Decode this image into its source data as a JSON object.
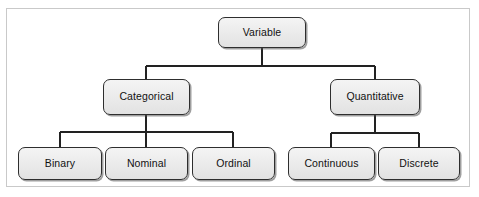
{
  "diagram": {
    "background_color": "#ffffff",
    "frame_border_color": "#c9c9c9",
    "node_fill_color": "#ececec",
    "node_border_color": "#2e2e2e",
    "connector_color": "#222222",
    "text_color": "#111111",
    "type": "tree",
    "levels": 3,
    "nodes": [
      {
        "id": "variable",
        "label": "Variable",
        "level": 1,
        "parent": null,
        "x": 218,
        "y": 17,
        "width": 88,
        "height": 31
      },
      {
        "id": "categorical",
        "label": "Categorical",
        "level": 2,
        "parent": "variable",
        "x": 103,
        "y": 79,
        "width": 87,
        "height": 36
      },
      {
        "id": "quantitative",
        "label": "Quantitative",
        "level": 2,
        "parent": "variable",
        "x": 330,
        "y": 79,
        "width": 90,
        "height": 36
      },
      {
        "id": "binary",
        "label": "Binary",
        "level": 3,
        "parent": "categorical",
        "x": 18,
        "y": 147,
        "width": 84,
        "height": 33
      },
      {
        "id": "nominal",
        "label": "Nominal",
        "level": 3,
        "parent": "categorical",
        "x": 105,
        "y": 147,
        "width": 83,
        "height": 33
      },
      {
        "id": "ordinal",
        "label": "Ordinal",
        "level": 3,
        "parent": "categorical",
        "x": 192,
        "y": 147,
        "width": 83,
        "height": 33
      },
      {
        "id": "continuous",
        "label": "Continuous",
        "level": 3,
        "parent": "quantitative",
        "x": 288,
        "y": 147,
        "width": 87,
        "height": 33
      },
      {
        "id": "discrete",
        "label": "Discrete",
        "level": 3,
        "parent": "quantitative",
        "x": 378,
        "y": 147,
        "width": 82,
        "height": 33
      }
    ],
    "edges": [
      {
        "from": "variable",
        "to": "categorical"
      },
      {
        "from": "variable",
        "to": "quantitative"
      },
      {
        "from": "categorical",
        "to": "binary"
      },
      {
        "from": "categorical",
        "to": "nominal"
      },
      {
        "from": "categorical",
        "to": "ordinal"
      },
      {
        "from": "quantitative",
        "to": "continuous"
      },
      {
        "from": "quantitative",
        "to": "discrete"
      }
    ]
  }
}
